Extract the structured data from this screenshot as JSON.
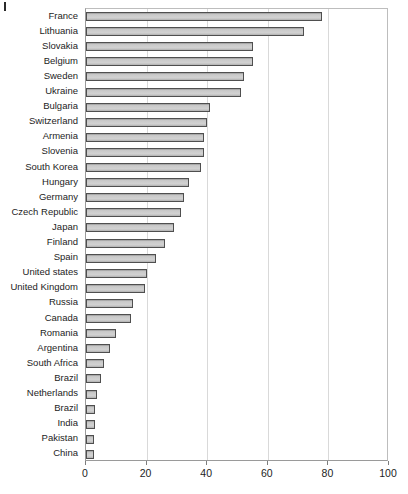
{
  "figure": {
    "background_color": "#ffffff",
    "bar_fill_color": "#cccccc",
    "bar_border_color": "#4f4f4f",
    "grid_color": "#d9d9d9",
    "axis_color": "#9a9a9a"
  },
  "chart_data": {
    "type": "bar",
    "orientation": "horizontal",
    "title": "",
    "subtitle": "",
    "xlabel": "",
    "ylabel": "",
    "xlim": [
      0,
      100
    ],
    "ylim": null,
    "grid": true,
    "legend": null,
    "xticks": [
      "0",
      "20",
      "40",
      "60",
      "80",
      "100"
    ],
    "xtick_values": [
      0,
      20,
      40,
      60,
      80,
      100
    ],
    "categories": [
      "France",
      "Lithuania",
      "Slovakia",
      "Belgium",
      "Sweden",
      "Ukraine",
      "Bulgaria",
      "Switzerland",
      "Armenia",
      "Slovenia",
      "South Korea",
      "Hungary",
      "Germany",
      "Czech Republic",
      "Japan",
      "Finland",
      "Spain",
      "United states",
      "United Kingdom",
      "Russia",
      "Canada",
      "Romania",
      "Argentina",
      "South Africa",
      "Brazil",
      "Netherlands",
      "Brazil",
      "India",
      "Pakistan",
      "China"
    ],
    "values": [
      78,
      72,
      55,
      55,
      52,
      51,
      41,
      40,
      39,
      39,
      38,
      34,
      32.5,
      31.5,
      29,
      26,
      23,
      20,
      19.5,
      15.5,
      15,
      10,
      8,
      6,
      5,
      3.5,
      3,
      3,
      2.5,
      2.5
    ]
  }
}
